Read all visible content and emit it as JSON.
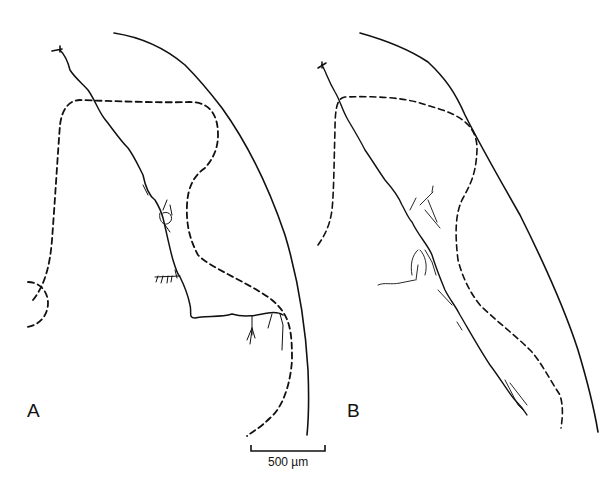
{
  "figure": {
    "panels": [
      {
        "label": "A"
      },
      {
        "label": "B"
      }
    ],
    "scale_bar": {
      "label": "500 µm"
    },
    "caption_fragment": ""
  }
}
